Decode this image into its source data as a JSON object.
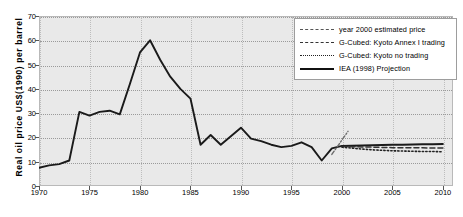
{
  "chart_data": {
    "type": "line",
    "title": "",
    "xlabel": "",
    "ylabel": "Real oil price US$(1990) per barrel",
    "xlim": [
      1970,
      2011
    ],
    "ylim": [
      0,
      70
    ],
    "ytick_labels": [
      "0",
      "10",
      "20",
      "30",
      "40",
      "50",
      "60",
      "70"
    ],
    "yticks": [
      0,
      10,
      20,
      30,
      40,
      50,
      60,
      70
    ],
    "xtick_labels": [
      "1970",
      "1975",
      "1980",
      "1985",
      "1990",
      "1995",
      "2000",
      "2005",
      "2010"
    ],
    "xticks": [
      1970,
      1975,
      1980,
      1985,
      1990,
      1995,
      2000,
      2005,
      2010
    ],
    "grid": true,
    "legend_position": "top-right",
    "series": [
      {
        "name": "IEA (1998) Projection",
        "style": "solid",
        "color": "#1a1a1a",
        "x": [
          1970,
          1971,
          1972,
          1973,
          1974,
          1975,
          1976,
          1977,
          1978,
          1979,
          1980,
          1981,
          1982,
          1983,
          1984,
          1985,
          1986,
          1987,
          1988,
          1989,
          1990,
          1991,
          1992,
          1993,
          1994,
          1995,
          1996,
          1997,
          1998,
          1999,
          2000,
          2001,
          2002,
          2003,
          2004,
          2005,
          2006,
          2007,
          2008,
          2009,
          2010
        ],
        "y": [
          7.5,
          8.5,
          9.0,
          10.5,
          30.5,
          29.0,
          30.5,
          31.0,
          29.5,
          42.0,
          55.0,
          60.0,
          52.0,
          45.0,
          40.0,
          36.0,
          17.0,
          21.0,
          17.0,
          20.5,
          24.0,
          19.5,
          18.5,
          17.0,
          16.0,
          16.5,
          18.0,
          16.0,
          10.5,
          15.5,
          16.5,
          16.6,
          16.7,
          16.8,
          16.9,
          17.0,
          17.0,
          17.1,
          17.2,
          17.2,
          17.3
        ]
      },
      {
        "name": "G-Cubed: Kyoto Annex I trading",
        "style": "dashed",
        "color": "#333333",
        "x": [
          2000,
          2001,
          2002,
          2003,
          2004,
          2005,
          2006,
          2007,
          2008,
          2009,
          2010
        ],
        "y": [
          16.3,
          16.2,
          16.1,
          16.0,
          15.9,
          15.8,
          15.8,
          15.7,
          15.7,
          15.6,
          15.6
        ]
      },
      {
        "name": "G-Cubed: Kyoto no trading",
        "style": "dotted",
        "color": "#222222",
        "x": [
          2000,
          2001,
          2002,
          2003,
          2004,
          2005,
          2006,
          2007,
          2008,
          2009,
          2010
        ],
        "y": [
          16.0,
          15.6,
          15.2,
          14.9,
          14.7,
          14.5,
          14.4,
          14.3,
          14.2,
          14.2,
          14.1
        ]
      },
      {
        "name": "year 2000 estimated price",
        "style": "dashdot",
        "color": "#6b6b6b",
        "x": [
          1999.0,
          2000.6
        ],
        "y": [
          13.0,
          22.5
        ]
      }
    ],
    "legend": [
      {
        "label": "year 2000 estimated price",
        "key": "dashdot"
      },
      {
        "label": "G-Cubed: Kyoto Annex I trading",
        "key": "dash"
      },
      {
        "label": "G-Cubed: Kyoto no trading",
        "key": "dot"
      },
      {
        "label": "IEA (1998) Projection",
        "key": "solid"
      }
    ]
  }
}
